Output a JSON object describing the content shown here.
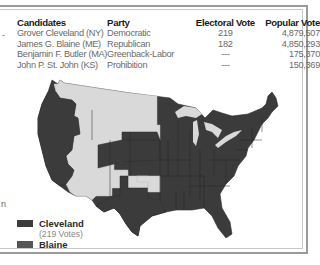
{
  "table": {
    "headers": [
      "Candidates",
      "Party",
      "Electoral Vote",
      "Popular Vote"
    ],
    "rows": [
      {
        "candidate": "Grover Cleveland (NY)",
        "party": "Democratic",
        "electoral": "219",
        "popular": "4,879,507"
      },
      {
        "candidate": "James G. Blaine (ME)",
        "party": "Republican",
        "electoral": "182",
        "popular": "4,850,293"
      },
      {
        "candidate": "Benjamin F. Butler (MA)",
        "party": "Greenback-Labor",
        "electoral": "---",
        "popular": "175,370"
      },
      {
        "candidate": "John P. St. John (KS)",
        "party": "Prohibition",
        "electoral": "---",
        "popular": "150,369"
      }
    ]
  },
  "legend": {
    "items": [
      {
        "label": "Cleveland",
        "sublabel": "(219 Votes)",
        "color": "#3b3b3b"
      },
      {
        "label": "Blaine",
        "sublabel": "",
        "color": "#555555"
      }
    ]
  },
  "map": {
    "colors": {
      "cleveland": "#3b3b3b",
      "blaine": "#4a4a4a",
      "territory": "#d9d9d9",
      "lakes": "#d9d9d9",
      "border": "#2a2a2a"
    }
  },
  "edge_fragments": [
    "-",
    "n"
  ]
}
